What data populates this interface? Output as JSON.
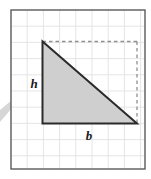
{
  "figure": {
    "name": "right-triangle-base-height-diagram",
    "background_color": "#ffffff",
    "panel": {
      "name": "graph-paper-panel",
      "x": 11,
      "y": 10,
      "width": 134,
      "height": 159,
      "fill": "#ffffff",
      "border_color": "#5a5a5a",
      "border_width": 1.4
    },
    "grid": {
      "color": "#e2e2e2",
      "line_width": 0.9,
      "cell_size": 16.2,
      "vertical_lines_x": [
        27.2,
        43.4,
        59.6,
        75.8,
        92.0,
        108.2,
        124.4,
        140.6
      ],
      "horizontal_lines_y": [
        26.2,
        42.4,
        58.6,
        74.8,
        91.0,
        107.2,
        123.4,
        139.6,
        155.8
      ]
    },
    "triangle": {
      "name": "shaded-right-triangle",
      "fill": "#cfcfcf",
      "stroke": "#2b2b2b",
      "stroke_width": 2,
      "vertices": [
        {
          "label": "apex",
          "x": 42.5,
          "y": 41.5
        },
        {
          "label": "bottom-left",
          "x": 42.5,
          "y": 123.5
        },
        {
          "label": "bottom-right",
          "x": 137.0,
          "y": 123.5
        }
      ]
    },
    "dashed_rectangle": {
      "name": "dashed-completion-lines",
      "stroke": "#8f8f8f",
      "stroke_width": 1.3,
      "dash_pattern": "3.5 3",
      "top_segment": {
        "x1": 42.5,
        "y1": 41.5,
        "x2": 137.0,
        "y2": 41.5
      },
      "right_segment": {
        "x1": 137.0,
        "y1": 41.5,
        "x2": 137.0,
        "y2": 123.5
      }
    },
    "labels": [
      {
        "name": "height-label",
        "text": "h",
        "meaning": "height of the triangle",
        "x": 34.0,
        "y": 88.0
      },
      {
        "name": "base-label",
        "text": "b",
        "meaning": "base of the triangle",
        "x": 89.0,
        "y": 140.0
      }
    ],
    "page_artifact": {
      "name": "page-curl-shadow",
      "description": "light grey wedge shadow at the left margin",
      "color": "#d6d6d6",
      "points": "0,122 18,101 12,100 0,110"
    }
  }
}
